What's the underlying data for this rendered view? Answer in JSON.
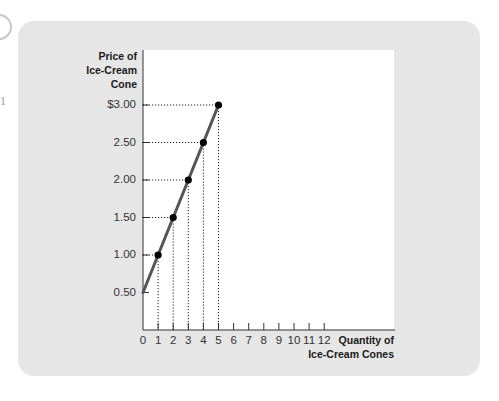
{
  "chart_data": {
    "type": "line",
    "title": "",
    "xlabel": "Quantity of Ice-Cream Cones",
    "ylabel": "Price of Ice-Cream Cone",
    "ylabel_lines": [
      "Price of",
      "Ice-Cream",
      "Cone"
    ],
    "xlabel_lines": [
      "Quantity of",
      "Ice-Cream Cones"
    ],
    "x_ticks": [
      "0",
      "1",
      "2",
      "3",
      "4",
      "5",
      "6",
      "7",
      "8",
      "9",
      "10",
      "11",
      "12"
    ],
    "y_ticks": [
      "0.50",
      "1.00",
      "1.50",
      "2.00",
      "2.50",
      "$3.00"
    ],
    "xlim": [
      0,
      12.5
    ],
    "ylim": [
      0,
      3.5
    ],
    "grid": false,
    "legend": null,
    "series": [
      {
        "name": "Supply",
        "x": [
          0,
          1,
          2,
          3,
          4,
          5
        ],
        "y": [
          0.5,
          1.0,
          1.5,
          2.0,
          2.5,
          3.0
        ],
        "markers_at_x": [
          1,
          2,
          3,
          4,
          5
        ],
        "color": "#555555"
      }
    ],
    "annotations": "Dotted guide lines from each marked point to both axes"
  },
  "artifacts": {
    "left_char": "1"
  }
}
